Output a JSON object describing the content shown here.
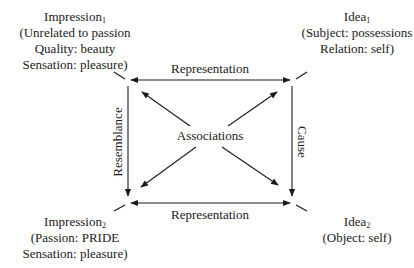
{
  "nodes": {
    "impression1": {
      "title": "Impression",
      "sub": "1",
      "lines": [
        "(Unrelated to passion",
        "Quality: beauty",
        "Sensation: pleasure)"
      ]
    },
    "idea1": {
      "title": "Idea",
      "sub": "1",
      "lines": [
        "(Subject: possessions",
        "Relation: self)"
      ]
    },
    "impression2": {
      "title": "Impression",
      "sub": "2",
      "lines": [
        "(Passion: PRIDE",
        "Sensation: pleasure)"
      ]
    },
    "idea2": {
      "title": "Idea",
      "sub": "2",
      "lines": [
        "(Object: self)"
      ]
    }
  },
  "edges": {
    "top": "Representation",
    "bottom": "Representation",
    "left": "Resemblance",
    "right": "Cause",
    "center": "Associations"
  },
  "colors": {
    "line": "#1a1a1a",
    "background": "#ffffff"
  }
}
